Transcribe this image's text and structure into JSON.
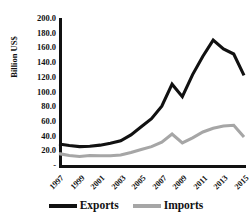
{
  "chart_data": {
    "type": "line",
    "title": "",
    "xlabel": "",
    "ylabel": "Billion US$",
    "grid": false,
    "legend_position": "bottom",
    "x": [
      1997,
      1998,
      1999,
      2000,
      2001,
      2002,
      2003,
      2004,
      2005,
      2006,
      2007,
      2008,
      2009,
      2010,
      2011,
      2012,
      2013,
      2014,
      2015
    ],
    "xlim": [
      1997,
      2015
    ],
    "ylim": [
      0,
      200
    ],
    "ytick_labels": [
      "200.0",
      "180.0",
      "160.0",
      "140.0",
      "120.0",
      "100.0",
      "80.0",
      "60.0",
      "40.0",
      "20.0",
      "-"
    ],
    "ytick_values": [
      200,
      180,
      160,
      140,
      120,
      100,
      80,
      60,
      40,
      20,
      0
    ],
    "xtick_labels": [
      "1997",
      "1999",
      "2001",
      "2003",
      "2005",
      "2007",
      "2009",
      "2011",
      "2013",
      "2015"
    ],
    "xtick_values": [
      1997,
      1999,
      2001,
      2003,
      2005,
      2007,
      2009,
      2011,
      2013,
      2015
    ],
    "series": [
      {
        "name": "Exports",
        "color": "#111111",
        "values": [
          28.5,
          26.5,
          25.0,
          25.5,
          27.0,
          29.5,
          33.0,
          41.0,
          52.0,
          63.0,
          80.0,
          110.0,
          93.0,
          123.0,
          148.0,
          170.0,
          158.0,
          151.0,
          122.0
        ]
      },
      {
        "name": "Imports",
        "color": "#a6a6a6",
        "values": [
          15.5,
          13.0,
          11.5,
          13.0,
          12.5,
          12.5,
          13.5,
          17.0,
          21.0,
          25.0,
          31.0,
          42.0,
          30.0,
          37.0,
          45.0,
          50.0,
          53.0,
          54.0,
          38.0
        ]
      }
    ]
  },
  "legend": {
    "items": [
      {
        "label": "Exports",
        "color": "#111111"
      },
      {
        "label": "Imports",
        "color": "#a6a6a6"
      }
    ]
  }
}
